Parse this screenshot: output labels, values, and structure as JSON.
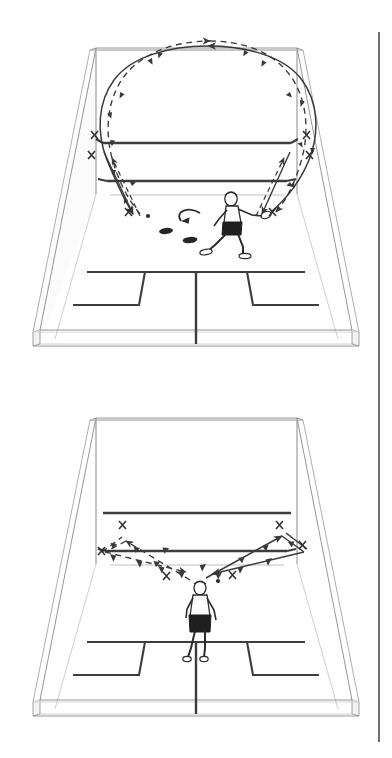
{
  "page": {
    "background_color": "#ffffff",
    "ink_color": "#3a3a3a",
    "line_color": "#555555",
    "court_line_color": "#404040",
    "accent_dark": "#222222",
    "margin_rule": {
      "name": "right-page-margin-rule",
      "color": "#6e6e6e",
      "x": 378,
      "y_top": 32,
      "y_bottom": 742,
      "width": 2
    }
  },
  "figures": [
    {
      "id": "figure-top",
      "caption": "",
      "court": {
        "view": "three-quarter perspective, squash court, front wall at top",
        "front_wall": {
          "out_line_label": "out line",
          "service_line_label": "service line",
          "board_tin_label": "tin"
        },
        "floor": {
          "half_court_line_label": "half court line",
          "short_line_label": "short line",
          "service_boxes": [
            "left service box",
            "right service box"
          ]
        }
      },
      "player": {
        "name": "player-figure-top",
        "pose": "lunging forward to the right with racket extended",
        "facing": "right front corner"
      },
      "floor_markers": [
        {
          "name": "cone-marker-left",
          "shape": "oval"
        },
        {
          "name": "cone-marker-right",
          "shape": "oval"
        }
      ],
      "movement_arrow": {
        "name": "player-movement-arrow",
        "style": "curved solid arrow",
        "direction": "right to left"
      },
      "ball_marks": {
        "symbol": "X",
        "left_wall_marks": 3,
        "right_wall_marks": 3,
        "description": "ball contact marks on side walls near front corners"
      },
      "trajectories": [
        {
          "name": "solid-loop-trajectory",
          "style": "solid",
          "arrowheads": 10,
          "description": "high solid arc from right side over the front wall down to the left side"
        },
        {
          "name": "dashed-loop-trajectory",
          "style": "dashed",
          "arrowheads": 10,
          "description": "dashed arc mirroring the solid path, returning across the front wall"
        }
      ],
      "ball_dots": 1
    },
    {
      "id": "figure-bottom",
      "caption": "",
      "court": {
        "view": "three-quarter perspective, squash court, front wall at top",
        "front_wall": {
          "out_line_label": "out line",
          "service_line_label": "service line",
          "board_tin_label": "tin"
        },
        "floor": {
          "half_court_line_label": "half court line",
          "short_line_label": "short line",
          "service_boxes": [
            "left service box",
            "right service box"
          ]
        }
      },
      "player": {
        "name": "player-figure-bottom",
        "pose": "standing at the T facing the front wall, seen from behind",
        "facing": "front wall"
      },
      "floor_markers": [],
      "movement_arrow": null,
      "ball_marks": {
        "symbol": "X",
        "left_wall_marks": 3,
        "right_wall_marks": 3,
        "description": "ball contact marks on side walls and near the T"
      },
      "trajectories": [
        {
          "name": "left-v-trajectory",
          "style": "dashed",
          "arrowheads": 9,
          "description": "dashed V shaped path from the T out to the left side wall and back"
        },
        {
          "name": "right-v-trajectory",
          "style": "solid",
          "arrowheads": 9,
          "description": "solid V shaped path from the T out to the right side wall and back"
        }
      ],
      "ball_dots": 1
    }
  ]
}
